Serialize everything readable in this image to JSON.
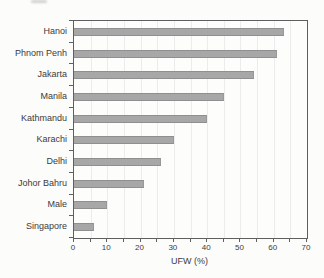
{
  "chart_data": {
    "type": "bar",
    "orientation": "horizontal",
    "title": "",
    "xlabel": "UFW (%)",
    "ylabel": "",
    "categories": [
      "Hanoi",
      "Phnom Penh",
      "Jakarta",
      "Manila",
      "Kathmandu",
      "Karachi",
      "Delhi",
      "Johor Bahru",
      "Male",
      "Singapore"
    ],
    "values": [
      63,
      61,
      54,
      45,
      40,
      30,
      26,
      21,
      10,
      6
    ],
    "xlim": [
      0,
      70
    ],
    "x_major_ticks": [
      0,
      10,
      20,
      30,
      40,
      50,
      60,
      70
    ],
    "x_minor_tick_step": 5,
    "grid": "faint vertical gridlines every 5 units",
    "legend": "none",
    "bar_color": "#a7a7a7",
    "frame_color": "#5f5f5f",
    "text_color": "#3b3b3b",
    "gridline_color": "#ececec",
    "background_color": "#fcfcfb"
  }
}
